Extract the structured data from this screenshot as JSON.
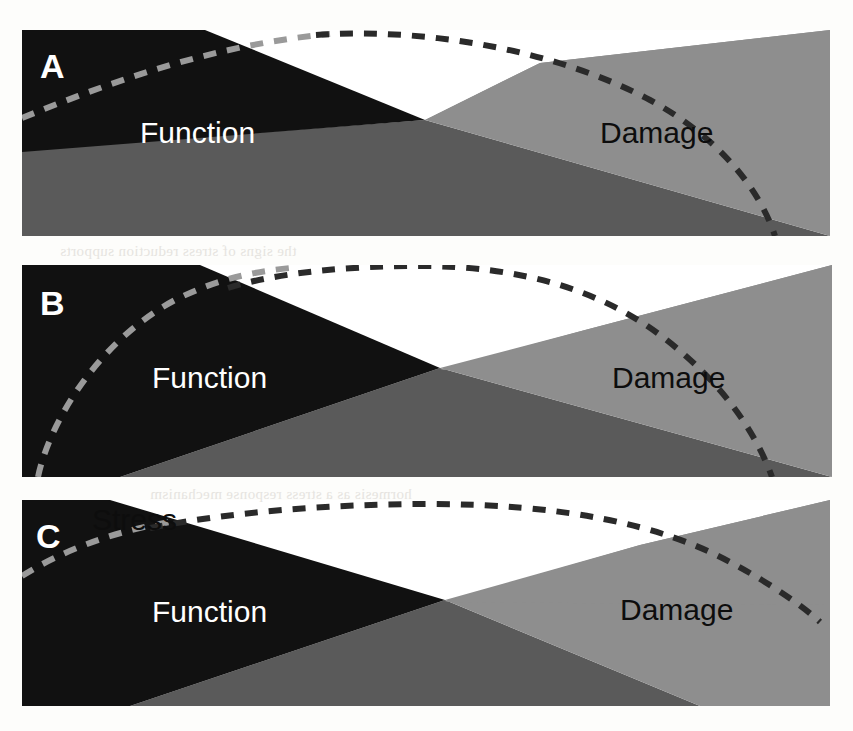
{
  "figure": {
    "type": "diagram",
    "width": 853,
    "height": 731,
    "background_color": "#fdfdfb"
  },
  "colors": {
    "function_black": "#111111",
    "damage_light_gray": "#8e8e8e",
    "mid_gray": "#5a5a5a",
    "white": "#ffffff",
    "stress_dash_dark": "#2a2a2a",
    "stress_dash_light": "#9a9a9a",
    "label_on_black": "#ffffff",
    "label_on_gray": "#0d0d0d"
  },
  "panels": [
    {
      "id": "A",
      "label": "A",
      "label_color": "#ffffff",
      "x": 22,
      "y": 30,
      "width": 808,
      "height": 206,
      "function_label": "Function",
      "function_label_color": "#ffffff",
      "damage_label": "Damage",
      "damage_label_color": "#0d0d0d",
      "stress_label": "",
      "stress_curve": "low-flat-early-decline",
      "crossover_x": 425
    },
    {
      "id": "B",
      "label": "B",
      "label_color": "#ffffff",
      "x": 22,
      "y": 265,
      "width": 810,
      "height": 212,
      "function_label": "Function",
      "function_label_color": "#ffffff",
      "damage_label": "Damage",
      "damage_label_color": "#0d0d0d",
      "stress_label": "",
      "stress_curve": "tall-steep-peak",
      "crossover_x": 440
    },
    {
      "id": "C",
      "label": "C",
      "label_color": "#ffffff",
      "x": 22,
      "y": 500,
      "width": 808,
      "height": 206,
      "function_label": "Function",
      "function_label_color": "#ffffff",
      "damage_label": "Damage",
      "damage_label_color": "#0d0d0d",
      "stress_label": "Stress",
      "stress_label_color": "#0d0d0d",
      "stress_curve": "flat-broad-late-decline",
      "crossover_x": 445
    }
  ],
  "legend": {
    "function_meaning": "Function",
    "damage_meaning": "Damage",
    "stress_meaning": "Stress"
  },
  "bleedthrough_text": [
    "the signs of stress reduction supports",
    "hormesis as a stress response mechanism"
  ]
}
